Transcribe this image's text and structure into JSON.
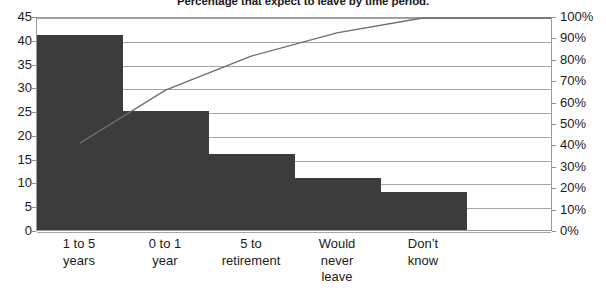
{
  "chart_data": {
    "type": "bar",
    "title": "Percentage that expect to leave by time period.",
    "xlabel": "",
    "ylabel": "",
    "grid": true,
    "legend": false,
    "categories": [
      "1 to 5\nyears",
      "0 to 1\nyear",
      "5 to\nretirement",
      "Would\nnever\nleave",
      "Don't\nknow"
    ],
    "category_labels": [
      {
        "line1": "1 to 5",
        "line2": "years",
        "line3": ""
      },
      {
        "line1": "0 to 1",
        "line2": "year",
        "line3": ""
      },
      {
        "line1": "5 to",
        "line2": "retirement",
        "line3": ""
      },
      {
        "line1": "Would",
        "line2": "never",
        "line3": "leave"
      },
      {
        "line1": "Don’t",
        "line2": "know",
        "line3": ""
      }
    ],
    "series": [
      {
        "name": "Percentage",
        "type": "bar",
        "axis": "left",
        "values": [
          41,
          25,
          16,
          11,
          8
        ],
        "color": "#3c3c3c"
      },
      {
        "name": "Cumulative percentage",
        "type": "line",
        "axis": "right",
        "values": [
          41,
          66,
          82,
          93,
          100
        ],
        "color": "#6e6e6e"
      }
    ],
    "empty_slots": 1,
    "total_slots": 6,
    "y_left": {
      "min": 0,
      "max": 45,
      "step": 5,
      "ticks": [
        "0",
        "5",
        "10",
        "15",
        "20",
        "25",
        "30",
        "35",
        "40",
        "45"
      ]
    },
    "y_right": {
      "min": 0,
      "max": 100,
      "step": 10,
      "ticks": [
        "0%",
        "10%",
        "20%",
        "30%",
        "40%",
        "50%",
        "60%",
        "70%",
        "80%",
        "90%",
        "100%"
      ]
    },
    "colors": {
      "bar": "#3c3c3c",
      "line": "#6e6e6e",
      "grid": "#a6a6a6",
      "axis": "#9a9a9a",
      "text": "#1a1a1a",
      "background": "#ffffff"
    }
  }
}
